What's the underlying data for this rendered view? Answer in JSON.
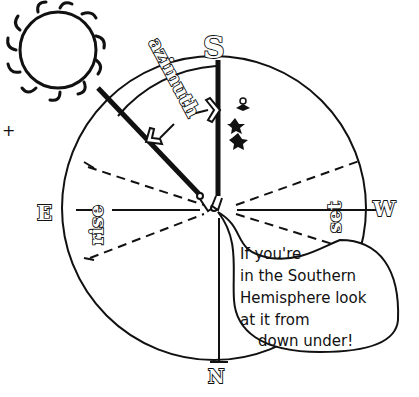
{
  "diagram": {
    "compass": {
      "north": "N",
      "south": "S",
      "east": "E",
      "west": "W"
    },
    "labels": {
      "azimuth": "azimuth",
      "rise": "rise",
      "set": "set"
    },
    "speech_bubble": {
      "lines": [
        "If you're",
        "in the Southern",
        "Hemisphere look",
        "at it from",
        "down under!"
      ]
    },
    "margin_mark": "+",
    "colors": {
      "ink": "#111111",
      "paper": "#ffffff"
    }
  }
}
